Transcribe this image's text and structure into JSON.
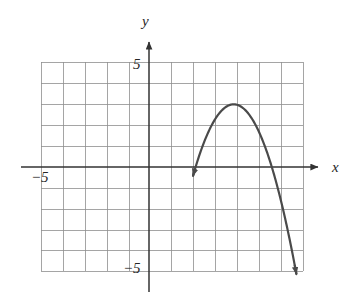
{
  "figure": {
    "name": "coordinate-plane-parabola",
    "background_color": "#ffffff",
    "grid_color": "#8e8e8e",
    "axis_color": "#333333",
    "curve_color": "#4a4a4a"
  },
  "axes": {
    "x_axis_label": "x",
    "y_axis_label": "y",
    "x_tick_label": "−5",
    "y_tick_top_label": "5",
    "y_tick_bottom_label": "−5",
    "x_range": [
      -5,
      7
    ],
    "y_range": [
      -5,
      5
    ],
    "grid": true,
    "grid_step": 1,
    "arrowheads": [
      "x-positive",
      "y-positive"
    ]
  },
  "chart_data": {
    "type": "line",
    "title": "",
    "xlabel": "x",
    "ylabel": "y",
    "xlim": [
      -5,
      7
    ],
    "ylim": [
      -5,
      5
    ],
    "grid": true,
    "legend": "none",
    "series": [
      {
        "name": "parabola",
        "shape": "downward-opening parabola",
        "vertex": [
          3.85,
          3.0
        ],
        "x_intercepts": [
          2.2,
          5.55
        ],
        "equation": "y = -(x - 3.85)^2 + 3",
        "x": [
          2.05,
          2.3,
          2.6,
          2.9,
          3.2,
          3.5,
          3.85,
          4.2,
          4.5,
          4.8,
          5.1,
          5.4,
          5.7,
          6.0,
          6.3,
          6.65
        ],
        "y": [
          -0.24,
          0.6,
          1.44,
          2.1,
          2.58,
          2.88,
          3.0,
          2.88,
          2.58,
          2.1,
          1.44,
          0.6,
          -0.42,
          -1.62,
          -3.0,
          -4.84
        ],
        "endpoint_arrows": true,
        "endpoints": [
          [
            2.0,
            -4.6
          ],
          [
            6.7,
            -5.1
          ]
        ]
      }
    ]
  }
}
